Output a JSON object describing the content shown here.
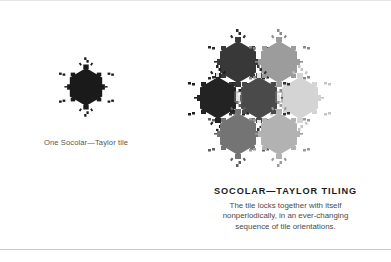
{
  "figure": {
    "single_tile": {
      "caption": "One Socolar—Taylor tile",
      "color": "#1a1a1a"
    },
    "tiling": {
      "title": "SOCOLAR—TAYLOR TILING",
      "description_lines": [
        "The tile locks together with itself",
        "nonperiodically, in an ever-changing",
        "sequence of tile orientations."
      ],
      "tiles": [
        {
          "position": "top-left",
          "color": "#383838"
        },
        {
          "position": "top-right",
          "color": "#9c9c9c"
        },
        {
          "position": "middle-left",
          "color": "#232323"
        },
        {
          "position": "middle-center",
          "color": "#4a4a4a"
        },
        {
          "position": "middle-right",
          "color": "#d4d4d4"
        },
        {
          "position": "bottom-left",
          "color": "#747474"
        },
        {
          "position": "bottom-right",
          "color": "#b2b2b2"
        }
      ]
    }
  },
  "colors": {
    "background": "#ffffff",
    "rule": "#c8c8c8",
    "title_text": "#1c1c1c",
    "body_text": "#4a4a4a"
  }
}
